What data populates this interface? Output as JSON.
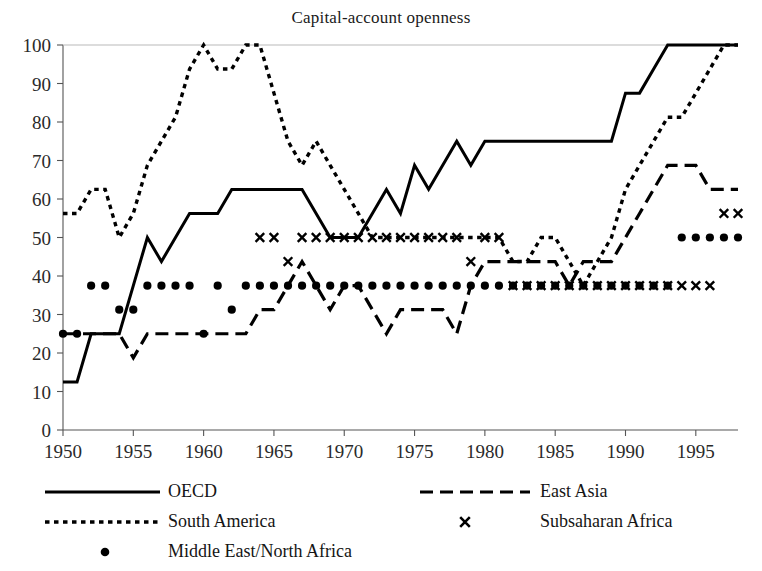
{
  "chart_data": {
    "type": "line",
    "title": "Capital-account openness",
    "xlabel": "",
    "ylabel": "",
    "xlim": [
      1950,
      1998
    ],
    "ylim": [
      0,
      100
    ],
    "grid": false,
    "legend_position": "below",
    "x_ticks": [
      "1950",
      "1955",
      "1960",
      "1965",
      "1970",
      "1975",
      "1980",
      "1985",
      "1990",
      "1995"
    ],
    "x_tick_values": [
      1950,
      1955,
      1960,
      1965,
      1970,
      1975,
      1980,
      1985,
      1990,
      1995
    ],
    "y_ticks": [
      "0",
      "10",
      "20",
      "30",
      "40",
      "50",
      "60",
      "70",
      "80",
      "90",
      "100"
    ],
    "y_tick_values": [
      0,
      10,
      20,
      30,
      40,
      50,
      60,
      70,
      80,
      90,
      100
    ],
    "series": [
      {
        "name": "OECD",
        "style": "solid",
        "marker": "none",
        "color": "#000000",
        "x": [
          1950,
          1951,
          1952,
          1953,
          1954,
          1955,
          1956,
          1957,
          1958,
          1959,
          1960,
          1961,
          1962,
          1963,
          1964,
          1965,
          1966,
          1967,
          1968,
          1969,
          1970,
          1971,
          1972,
          1973,
          1974,
          1975,
          1976,
          1977,
          1978,
          1979,
          1980,
          1981,
          1982,
          1983,
          1984,
          1985,
          1986,
          1987,
          1988,
          1989,
          1990,
          1991,
          1992,
          1993,
          1994,
          1995,
          1996,
          1997,
          1998
        ],
        "values": [
          12.5,
          12.5,
          25,
          25,
          25,
          37.5,
          50,
          43.75,
          50,
          56.25,
          56.25,
          56.25,
          62.5,
          62.5,
          62.5,
          62.5,
          62.5,
          62.5,
          56.25,
          50,
          50,
          50,
          56.25,
          62.5,
          56.25,
          68.75,
          62.5,
          68.75,
          75,
          68.75,
          75,
          75,
          75,
          75,
          75,
          75,
          75,
          75,
          75,
          75,
          87.5,
          87.5,
          93.75,
          100,
          100,
          100,
          100,
          100,
          100
        ]
      },
      {
        "name": "East Asia",
        "style": "dashed",
        "marker": "none",
        "color": "#000000",
        "x": [
          1950,
          1951,
          1952,
          1953,
          1954,
          1955,
          1956,
          1957,
          1958,
          1959,
          1960,
          1961,
          1962,
          1963,
          1964,
          1965,
          1966,
          1967,
          1968,
          1969,
          1970,
          1971,
          1972,
          1973,
          1974,
          1975,
          1976,
          1977,
          1978,
          1979,
          1980,
          1981,
          1982,
          1983,
          1984,
          1985,
          1986,
          1987,
          1988,
          1989,
          1990,
          1991,
          1992,
          1993,
          1994,
          1995,
          1996,
          1997,
          1998
        ],
        "values": [
          25,
          25,
          25,
          25,
          25,
          18.75,
          25,
          25,
          25,
          25,
          25,
          25,
          25,
          25,
          31.25,
          31.25,
          37.5,
          43.75,
          37.5,
          31.25,
          37.5,
          37.5,
          31.25,
          25,
          31.25,
          31.25,
          31.25,
          31.25,
          25,
          37.5,
          43.75,
          43.75,
          43.75,
          43.75,
          43.75,
          43.75,
          37.5,
          43.75,
          43.75,
          43.75,
          50,
          56.25,
          62.5,
          68.75,
          68.75,
          68.75,
          62.5,
          62.5,
          62.5
        ]
      },
      {
        "name": "South America",
        "style": "dotted",
        "marker": "none",
        "color": "#000000",
        "x": [
          1950,
          1951,
          1952,
          1953,
          1954,
          1955,
          1956,
          1957,
          1958,
          1959,
          1960,
          1961,
          1962,
          1963,
          1964,
          1965,
          1966,
          1967,
          1968,
          1969,
          1970,
          1971,
          1972,
          1973,
          1974,
          1975,
          1976,
          1977,
          1978,
          1979,
          1980,
          1981,
          1982,
          1983,
          1984,
          1985,
          1986,
          1987,
          1988,
          1989,
          1990,
          1991,
          1992,
          1993,
          1994,
          1995,
          1996,
          1997,
          1998
        ],
        "values": [
          56.25,
          56.25,
          62.5,
          62.5,
          50,
          56.25,
          68.75,
          75,
          81.25,
          93.75,
          100,
          93.75,
          93.75,
          100,
          100,
          87.5,
          75,
          68.75,
          75,
          68.75,
          62.5,
          56.25,
          50,
          50,
          50,
          50,
          50,
          50,
          50,
          50,
          50,
          50,
          43.75,
          43.75,
          50,
          50,
          43.75,
          37.5,
          43.75,
          50,
          62.5,
          68.75,
          75,
          81.25,
          81.25,
          87.5,
          93.75,
          100,
          100
        ]
      },
      {
        "name": "Subsaharan Africa",
        "style": "none",
        "marker": "x",
        "color": "#000000",
        "x": [
          1964,
          1965,
          1966,
          1967,
          1968,
          1969,
          1970,
          1971,
          1972,
          1973,
          1974,
          1975,
          1976,
          1977,
          1978,
          1979,
          1980,
          1981,
          1982,
          1983,
          1984,
          1985,
          1986,
          1987,
          1988,
          1989,
          1990,
          1991,
          1992,
          1993,
          1994,
          1995,
          1996,
          1997,
          1998
        ],
        "values": [
          50,
          50,
          43.75,
          50,
          50,
          50,
          50,
          50,
          50,
          50,
          50,
          50,
          50,
          50,
          50,
          43.75,
          50,
          50,
          37.5,
          37.5,
          37.5,
          37.5,
          37.5,
          37.5,
          37.5,
          37.5,
          37.5,
          37.5,
          37.5,
          37.5,
          37.5,
          37.5,
          37.5,
          56.25,
          56.25
        ]
      },
      {
        "name": "Middle East/North Africa",
        "style": "none",
        "marker": "dot",
        "color": "#000000",
        "x": [
          1950,
          1951,
          1952,
          1953,
          1954,
          1955,
          1956,
          1957,
          1958,
          1959,
          1960,
          1961,
          1962,
          1963,
          1964,
          1965,
          1966,
          1967,
          1968,
          1969,
          1970,
          1971,
          1972,
          1973,
          1974,
          1975,
          1976,
          1977,
          1978,
          1979,
          1980,
          1981,
          1982,
          1983,
          1984,
          1985,
          1986,
          1987,
          1988,
          1989,
          1990,
          1991,
          1992,
          1993,
          1994,
          1995,
          1996,
          1997,
          1998
        ],
        "values": [
          25,
          25,
          37.5,
          37.5,
          31.25,
          31.25,
          37.5,
          37.5,
          37.5,
          37.5,
          25,
          37.5,
          31.25,
          37.5,
          37.5,
          37.5,
          37.5,
          37.5,
          37.5,
          37.5,
          37.5,
          37.5,
          37.5,
          37.5,
          37.5,
          37.5,
          37.5,
          37.5,
          37.5,
          37.5,
          37.5,
          37.5,
          37.5,
          37.5,
          37.5,
          37.5,
          37.5,
          37.5,
          37.5,
          37.5,
          37.5,
          37.5,
          37.5,
          37.5,
          50,
          50,
          50,
          50,
          50
        ]
      }
    ]
  },
  "legend": {
    "entries": [
      {
        "label": "OECD",
        "style": "solid",
        "marker": "none"
      },
      {
        "label": "East Asia",
        "style": "dashed",
        "marker": "none"
      },
      {
        "label": "South America",
        "style": "dotted",
        "marker": "none"
      },
      {
        "label": "Subsaharan Africa",
        "style": "none",
        "marker": "x"
      },
      {
        "label": "Middle East/North Africa",
        "style": "none",
        "marker": "dot"
      }
    ]
  }
}
